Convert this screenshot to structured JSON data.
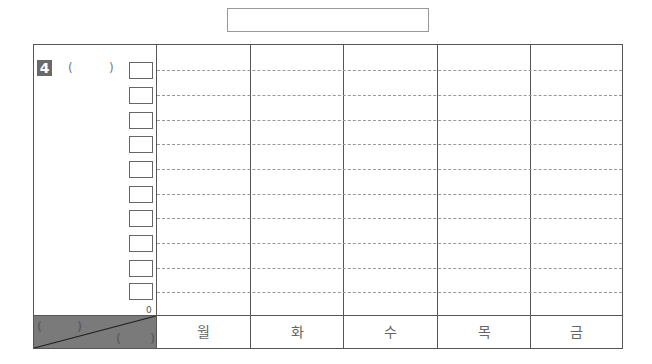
{
  "title_box": {
    "text": ""
  },
  "question": {
    "number": "4",
    "paren_open": "(",
    "paren_close": ")"
  },
  "y_axis": {
    "zero_label": "0",
    "boxes": [
      "",
      "",
      "",
      "",
      "",
      "",
      "",
      "",
      "",
      ""
    ]
  },
  "corner": {
    "top_left": {
      "open": "(",
      "close": ")"
    },
    "bottom_right": {
      "open": "(",
      "close": ")"
    }
  },
  "days": [
    {
      "label": "월"
    },
    {
      "label": "화"
    },
    {
      "label": "수"
    },
    {
      "label": "목"
    },
    {
      "label": "금"
    }
  ],
  "colors": {
    "badge": "#6a6a6a",
    "corner_fill": "#7a7a7a",
    "border": "#555555",
    "dash": "#999999"
  }
}
